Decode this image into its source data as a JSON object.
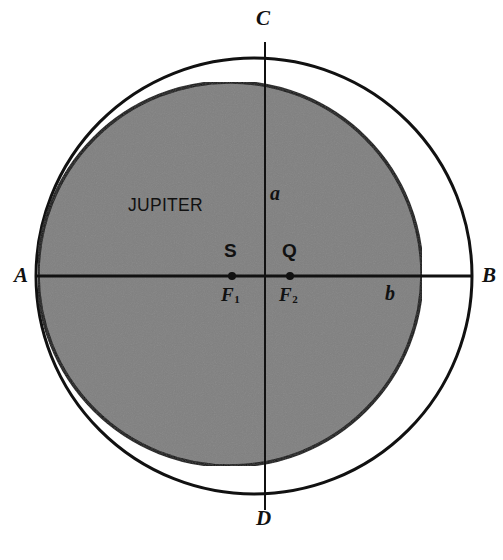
{
  "figure": {
    "kind": "orbital-diagram",
    "background_color": "#ffffff",
    "stroke_color": "#111111",
    "planet_fill_color": "#808080"
  },
  "labels": {
    "body_name": "JUPITER",
    "vertex_left": "A",
    "vertex_right": "B",
    "vertex_top": "C",
    "vertex_bottom": "D",
    "semi_axis_vertical": "a",
    "semi_axis_horizontal": "b",
    "point_left": "S",
    "point_right": "Q",
    "focus_left": "F",
    "focus_left_sub": "1",
    "focus_right": "F",
    "focus_right_sub": "2"
  },
  "chart_data": {
    "type": "scatter",
    "title": "",
    "xlabel": "",
    "ylabel": "",
    "shapes": [
      {
        "name": "outer-orbit-circle",
        "kind": "circle",
        "cx": 254,
        "cy": 276,
        "r": 218,
        "fill": "none",
        "stroke": "#111111",
        "stroke_width": 3
      },
      {
        "name": "jupiter-disk",
        "kind": "circle",
        "cx": 230,
        "cy": 274,
        "r": 192,
        "fill": "#808080",
        "stroke": "#111111",
        "stroke_width": 3.5
      }
    ],
    "axes_lines": [
      {
        "name": "horizontal-axis-AB",
        "x1": 36,
        "y1": 276,
        "x2": 472,
        "y2": 276,
        "stroke_width": 3
      },
      {
        "name": "vertical-axis-CD",
        "x1": 265,
        "y1": 42,
        "x2": 265,
        "y2": 510,
        "stroke_width": 2
      }
    ],
    "points": [
      {
        "name": "focus-1",
        "label": "F1",
        "alias": "S",
        "x": 232,
        "y": 276,
        "r": 4
      },
      {
        "name": "focus-2",
        "label": "F2",
        "alias": "Q",
        "x": 290,
        "y": 276,
        "r": 4
      }
    ],
    "annotations": [
      {
        "text": "A",
        "x": 20,
        "y": 276,
        "style": "italic-serif"
      },
      {
        "text": "B",
        "x": 487,
        "y": 276,
        "style": "italic-serif"
      },
      {
        "text": "C",
        "x": 265,
        "y": 20,
        "style": "italic-serif"
      },
      {
        "text": "D",
        "x": 265,
        "y": 521,
        "style": "italic-serif"
      },
      {
        "text": "a",
        "x": 275,
        "y": 195,
        "style": "italic-serif"
      },
      {
        "text": "b",
        "x": 391,
        "y": 295,
        "style": "italic-serif"
      },
      {
        "text": "S",
        "x": 231,
        "y": 252,
        "style": "sans"
      },
      {
        "text": "Q",
        "x": 290,
        "y": 252,
        "style": "sans"
      },
      {
        "text": "F1",
        "x": 231,
        "y": 298,
        "style": "italic-serif-sub"
      },
      {
        "text": "F2",
        "x": 290,
        "y": 298,
        "style": "italic-serif-sub"
      },
      {
        "text": "JUPITER",
        "x": 168,
        "y": 207,
        "style": "sans"
      }
    ],
    "grid": false,
    "legend": null
  }
}
